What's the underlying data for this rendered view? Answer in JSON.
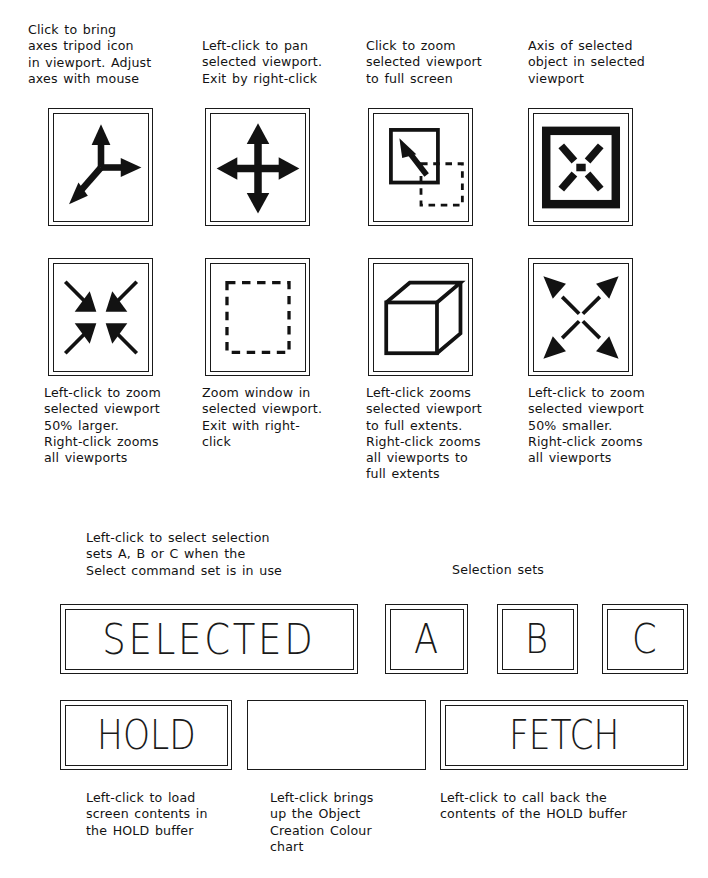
{
  "page": {
    "kind": "cad-toolbar-reference-sheet",
    "background_color": "#ffffff",
    "ink_color": "#1a1a1a"
  },
  "viewport_tools": {
    "top_captions": [
      "Click to bring\naxes tripod icon\nin viewport. Adjust\naxes with mouse",
      "Left-click to pan\nselected viewport.\nExit by right-click",
      "Click to zoom\nselected viewport\nto full screen",
      "Axis of selected\nobject in selected\nviewport"
    ],
    "bottom_captions": [
      "Left-click to zoom\nselected viewport\n50% larger.\nRight-click zooms\nall viewports",
      "Zoom window in\nselected viewport.\nExit with right-\nclick",
      "Left-click zooms\nselected viewport\nto full extents.\nRight-click zooms\nall viewports to\nfull extents",
      "Left-click to zoom\nselected viewport\n50% smaller.\nRight-click zooms\nall viewports"
    ],
    "icons_row_one": [
      {
        "name": "axes-tripod-icon",
        "description": "three axis arrows"
      },
      {
        "name": "pan-four-way-arrows-icon",
        "description": "four-way pan cross"
      },
      {
        "name": "zoom-full-screen-icon",
        "description": "window with arrow and dashed window"
      },
      {
        "name": "object-axis-icon",
        "description": "framed X with centre point"
      }
    ],
    "icons_row_two": [
      {
        "name": "zoom-in-arrows-icon",
        "description": "four arrows pointing inward"
      },
      {
        "name": "zoom-window-dashed-icon",
        "description": "dashed selection rectangle"
      },
      {
        "name": "zoom-extents-cube-icon",
        "description": "3D wireframe cube"
      },
      {
        "name": "zoom-out-arrows-icon",
        "description": "four arrows pointing outward"
      }
    ]
  },
  "selection": {
    "instruction": "Left-click to select selection\nsets A, B or C when the\nSelect command set is in use",
    "sets_label": "Selection sets",
    "selected_button": "SELECTED",
    "set_buttons": [
      "A",
      "B",
      "C"
    ]
  },
  "buffer": {
    "hold_button": "HOLD",
    "colour_button": "",
    "fetch_button": "FETCH",
    "captions": [
      "Left-click to load\nscreen contents in\nthe HOLD buffer",
      "Left-click brings\nup the Object\nCreation Colour\nchart",
      "Left-click to call back the\ncontents of the HOLD buffer"
    ]
  }
}
